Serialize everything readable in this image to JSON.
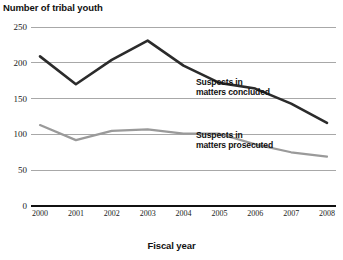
{
  "chart_data": {
    "type": "line",
    "title": "",
    "ylabel": "Number of tribal youth",
    "xlabel": "Fiscal year",
    "categories": [
      "2000",
      "2001",
      "2002",
      "2003",
      "2004",
      "2005",
      "2006",
      "2007",
      "2008"
    ],
    "ylim": [
      0,
      250
    ],
    "yticks": [
      0,
      50,
      100,
      150,
      200,
      250
    ],
    "ytick_labels": [
      "0",
      "50",
      "100",
      "150",
      "200",
      "250"
    ],
    "grid": true,
    "legend_position": "inline-right",
    "series": [
      {
        "name": "Suspects in matters concluded",
        "label_line1": "Suspects in",
        "label_line2": "matters concluded",
        "color": "#2b2b2b",
        "values": [
          209,
          170,
          204,
          231,
          196,
          172,
          164,
          143,
          116
        ]
      },
      {
        "name": "Suspects in matters prosecuted",
        "label_line1": "Suspects in",
        "label_line2": "matters prosecuted",
        "color": "#9a9a9a",
        "values": [
          113,
          92,
          105,
          107,
          101,
          101,
          86,
          75,
          69
        ]
      }
    ]
  }
}
